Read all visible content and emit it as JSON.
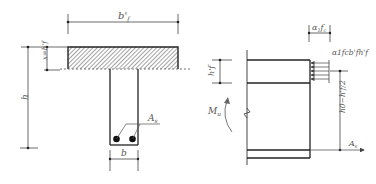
{
  "left_figure": {
    "flange_width_label": "b'f",
    "flange_width_sub": "f",
    "depth_label": "h",
    "x_label": "x=h'f",
    "web_width_label": "b",
    "steel_area_label": "As",
    "steel_label_main": "A",
    "steel_label_sub": "s"
  },
  "right_figure": {
    "stress_label": "α1fc",
    "stress_label_main": "α",
    "stress_label_sub1": "1",
    "stress_label_f": "f",
    "stress_label_sub2": "c",
    "force_label": "α1fcb'fh'f",
    "flange_height_label": "h'f",
    "lever_arm_label": "h0−h'f/2",
    "moment_label": "Mu",
    "moment_main": "M",
    "moment_sub": "u",
    "steel_label_main": "A",
    "steel_label_sub": "s"
  },
  "colors": {
    "line": "#333333",
    "hatch": "#555555",
    "label": "#555555"
  }
}
